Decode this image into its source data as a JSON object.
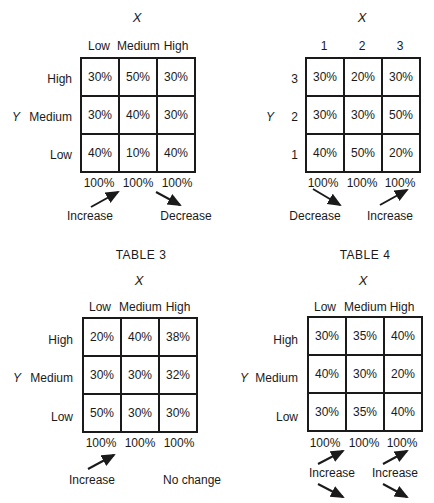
{
  "tables": [
    {
      "title": "",
      "x_axis": "X",
      "y_axis": "Y",
      "col_labels": [
        "Low",
        "Medium",
        "High"
      ],
      "row_labels": [
        "High",
        "Medium",
        "Low"
      ],
      "cells": [
        [
          "30%",
          "50%",
          "30%"
        ],
        [
          "30%",
          "40%",
          "30%"
        ],
        [
          "40%",
          "10%",
          "40%"
        ]
      ],
      "totals": [
        "100%",
        "100%",
        "100%"
      ],
      "notes": [
        "Increase",
        "Decrease"
      ]
    },
    {
      "title": "",
      "x_axis": "X",
      "y_axis": "Y",
      "col_labels": [
        "1",
        "2",
        "3"
      ],
      "row_labels": [
        "3",
        "2",
        "1"
      ],
      "cells": [
        [
          "30%",
          "20%",
          "30%"
        ],
        [
          "30%",
          "30%",
          "50%"
        ],
        [
          "40%",
          "50%",
          "20%"
        ]
      ],
      "totals": [
        "100%",
        "100%",
        "100%"
      ],
      "notes": [
        "Decrease",
        "Increase"
      ]
    },
    {
      "title": "TABLE 3",
      "x_axis": "X",
      "y_axis": "Y",
      "col_labels": [
        "Low",
        "Medium",
        "High"
      ],
      "row_labels": [
        "High",
        "Medium",
        "Low"
      ],
      "cells": [
        [
          "20%",
          "40%",
          "38%"
        ],
        [
          "30%",
          "30%",
          "32%"
        ],
        [
          "50%",
          "30%",
          "30%"
        ]
      ],
      "totals": [
        "100%",
        "100%",
        "100%"
      ],
      "notes": [
        "Increase",
        "No change"
      ]
    },
    {
      "title": "TABLE 4",
      "x_axis": "X",
      "y_axis": "Y",
      "col_labels": [
        "Low",
        "Medium",
        "High"
      ],
      "row_labels": [
        "High",
        "Medium",
        "Low"
      ],
      "cells": [
        [
          "30%",
          "35%",
          "40%"
        ],
        [
          "40%",
          "30%",
          "20%"
        ],
        [
          "30%",
          "35%",
          "40%"
        ]
      ],
      "totals": [
        "100%",
        "100%",
        "100%"
      ],
      "notes": [
        "Increase",
        "Increase"
      ]
    }
  ]
}
